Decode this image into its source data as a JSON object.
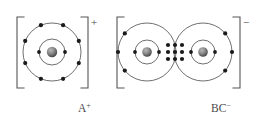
{
  "figure": {
    "type": "bohr-lewis-dot-ionic-diagram",
    "background_color": "#ffffff",
    "shell_color": "#4a4a4a",
    "electron_color": "#1a1a1a",
    "bracket_color": "#555555",
    "text_color": "#4a4a4a",
    "nucleus_color": "#7a7a7a"
  },
  "left_ion": {
    "label": "A",
    "label_superscript": "+",
    "bracket_charge": "+",
    "nucleus": {
      "cx": 52,
      "cy": 52,
      "r": 5.2
    },
    "shells": [
      {
        "name": "inner-shell",
        "r": 13,
        "electron_count": 2
      },
      {
        "name": "outer-shell",
        "r": 29,
        "electron_count": 8
      }
    ],
    "inner_electron_angles_deg": [
      0,
      180
    ],
    "outer_electron_angles_deg": [
      22.5,
      67.5,
      112.5,
      157.5,
      202.5,
      247.5,
      292.5,
      337.5
    ],
    "bracket_left_x": 17,
    "bracket_right_x": 88,
    "bracket_top_y": 17,
    "bracket_bottom_y": 88,
    "charge_x": 92,
    "charge_y": 24
  },
  "right_ion": {
    "label": "BC",
    "label_superscript": "−",
    "bracket_charge": "−",
    "atom_left": {
      "name": "atom-B",
      "nucleus": {
        "cx": 147,
        "cy": 52,
        "r": 4.8
      },
      "shells": [
        {
          "name": "inner-shell",
          "r": 12,
          "electron_count": 2
        },
        {
          "name": "outer-shell",
          "r": 29,
          "electron_count": 3
        }
      ],
      "inner_electron_angles_deg": [
        0,
        180
      ],
      "outer_electron_angles_deg": [
        140,
        180,
        220
      ]
    },
    "atom_right": {
      "name": "atom-C",
      "nucleus": {
        "cx": 203,
        "cy": 52,
        "r": 4.8
      },
      "shells": [
        {
          "name": "inner-shell",
          "r": 12,
          "electron_count": 2
        },
        {
          "name": "outer-shell",
          "r": 29,
          "electron_count": 3
        }
      ],
      "inner_electron_angles_deg": [
        0,
        180
      ],
      "outer_electron_angles_deg": [
        320,
        0,
        40
      ]
    },
    "shared_electrons": {
      "name": "shared-electron-cluster",
      "count": 8,
      "columns_x": [
        168,
        175,
        182
      ],
      "rows_y": [
        45,
        52,
        59
      ],
      "description": "cluster of shared electron dots in the overlap region between atom B and atom C"
    },
    "bracket_left_x": 117,
    "bracket_right_x": 240,
    "bracket_top_y": 17,
    "bracket_bottom_y": 88,
    "charge_x": 243,
    "charge_y": 24
  },
  "labels": {
    "left": {
      "base": "A",
      "sup": "+",
      "x": 78,
      "y": 110
    },
    "right": {
      "base": "BC",
      "sup": "−",
      "x": 215,
      "y": 110
    }
  }
}
